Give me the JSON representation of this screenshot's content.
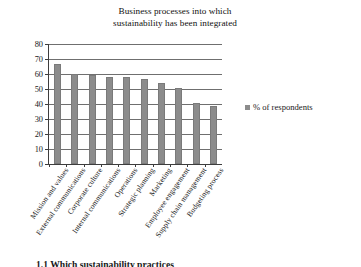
{
  "chart_data": {
    "type": "bar",
    "title": "Business processes into which sustainability has been integrated",
    "title_lines": [
      "Business processes into which",
      "sustainability has been integrated"
    ],
    "categories": [
      "Mission and values",
      "External communications",
      "Corporate culture",
      "Internal communications",
      "Operations",
      "Strategic planning",
      "Marketing",
      "Employee engagement",
      "Supply chain management",
      "Budgeting process"
    ],
    "values": [
      67,
      60,
      59.5,
      58,
      58,
      57,
      54,
      50.5,
      41,
      39
    ],
    "series": [
      {
        "name": "% of respondents",
        "values": [
          67,
          60,
          59.5,
          58,
          58,
          57,
          54,
          50.5,
          41,
          39
        ]
      }
    ],
    "xlabel": "",
    "ylabel": "",
    "ylim": [
      0,
      80
    ],
    "ytick_labels": [
      "80",
      "70",
      "60",
      "50",
      "40",
      "30",
      "20",
      "10",
      "0"
    ],
    "ytick_values": [
      80,
      70,
      60,
      50,
      40,
      30,
      20,
      10,
      0
    ],
    "ytick_step": 10,
    "grid": true,
    "grid_axis": "y",
    "legend": {
      "position": "right",
      "entries": [
        {
          "label": "% of respondents",
          "color": "#8c8c8c"
        }
      ]
    },
    "bar_color": "#8c8c8c",
    "axis_color": "#3d3d3d",
    "gridline_color": "#6f6f6f",
    "background": "#ffffff"
  },
  "caption": {
    "text": "1.1 Which sustainability practices"
  }
}
